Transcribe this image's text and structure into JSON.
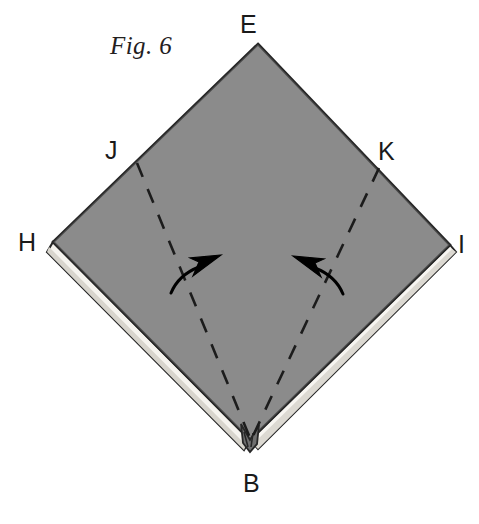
{
  "figure": {
    "caption": "Fig. 6",
    "domain": "origami-fold-diagram",
    "canvas": {
      "width": 479,
      "height": 524
    },
    "colors": {
      "paper_front": "#8a8a8a",
      "paper_back": "#f2f0ea",
      "outline": "#262626",
      "arrow": "#000000",
      "background": "#ffffff",
      "label_text": "#1a1a1a",
      "caption_text": "#23201e"
    },
    "labels": {
      "E": "E",
      "J": "J",
      "K": "K",
      "H": "H",
      "I": "I",
      "B": "B"
    },
    "vertices": {
      "E": {
        "x": 258,
        "y": 44,
        "role": "top-corner"
      },
      "H": {
        "x": 53,
        "y": 242,
        "role": "left-corner"
      },
      "I": {
        "x": 450,
        "y": 245,
        "role": "right-corner"
      },
      "B": {
        "x": 250,
        "y": 440,
        "role": "bottom-corner"
      },
      "J": {
        "x": 137,
        "y": 165,
        "role": "left-crease-endpoint"
      },
      "K": {
        "x": 378,
        "y": 170,
        "role": "right-crease-endpoint"
      }
    },
    "fold_lines": [
      {
        "name": "crease-J-B",
        "style": "dashed",
        "from": "J",
        "to": "B",
        "meaning": "valley-fold"
      },
      {
        "name": "crease-K-B",
        "style": "dashed",
        "from": "K",
        "to": "B",
        "meaning": "valley-fold"
      }
    ],
    "arrows": [
      {
        "name": "left-fold-arrow",
        "direction": "up-right",
        "tip": {
          "x": 217,
          "y": 259
        },
        "tail": {
          "x": 171,
          "y": 292
        },
        "meaning": "fold-left-flap-inward"
      },
      {
        "name": "right-fold-arrow",
        "direction": "up-left",
        "tip": {
          "x": 297,
          "y": 260
        },
        "tail": {
          "x": 341,
          "y": 293
        },
        "meaning": "fold-right-flap-inward"
      }
    ],
    "layers": [
      {
        "name": "bottom-left-edge-layer",
        "side": "lower-left",
        "thickness": "wide"
      },
      {
        "name": "bottom-right-edge-layer",
        "side": "lower-right",
        "thickness": "narrow"
      },
      {
        "name": "bottom-point-notch",
        "side": "bottom",
        "thickness": "notch"
      }
    ]
  }
}
